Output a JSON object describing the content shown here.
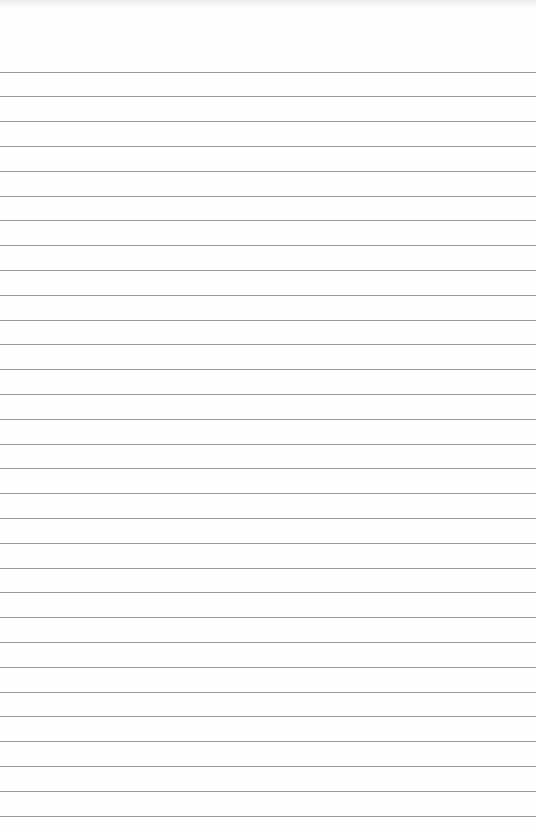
{
  "paper": {
    "type": "lined-paper",
    "background_color": "#fefefe",
    "line_color": "#9a9a9a",
    "first_line_y": 71.5,
    "line_spacing": 24.8,
    "line_count": 31
  }
}
